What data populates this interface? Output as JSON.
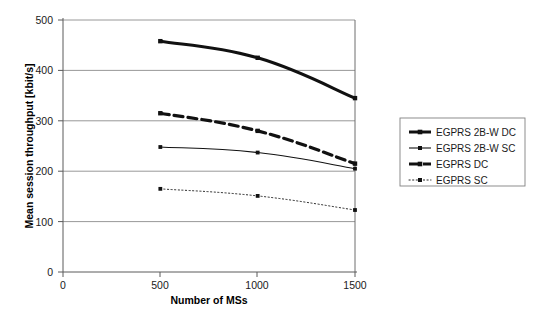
{
  "chart_data": {
    "type": "line",
    "title": "",
    "xlabel": "Number of MSs",
    "ylabel": "Mean session throughput [kbit/s]",
    "x": [
      500,
      1000,
      1500
    ],
    "xlim": [
      0,
      1750
    ],
    "ylim": [
      0,
      500
    ],
    "xticks": [
      0,
      500,
      1000,
      1500
    ],
    "xticklabels": [
      "0",
      "500",
      "1000",
      "1500"
    ],
    "yticks": [
      0,
      100,
      200,
      300,
      400,
      500
    ],
    "yticklabels": [
      "0",
      "100",
      "200",
      "300",
      "400",
      "500"
    ],
    "grid": "horizontal",
    "legend_position": "right",
    "series": [
      {
        "name": "EGPRS 2B-W DC",
        "values": [
          458,
          425,
          345
        ],
        "style": "solid",
        "width": "thick",
        "marker": "square",
        "color": "#111111"
      },
      {
        "name": "EGPRS 2B-W SC",
        "values": [
          248,
          237,
          205
        ],
        "style": "solid",
        "width": "thin",
        "marker": "square",
        "color": "#111111"
      },
      {
        "name": "EGPRS DC",
        "values": [
          315,
          280,
          215
        ],
        "style": "dashed",
        "width": "thick",
        "marker": "square",
        "color": "#111111"
      },
      {
        "name": "EGPRS SC",
        "values": [
          165,
          151,
          123
        ],
        "style": "dotted",
        "width": "thin",
        "marker": "square",
        "color": "#111111"
      }
    ]
  },
  "axes": {
    "y_title": "Mean session throughput [kbit/s]",
    "x_title": "Number of MSs",
    "y_tick_0": "0",
    "y_tick_100": "100",
    "y_tick_200": "200",
    "y_tick_300": "300",
    "y_tick_400": "400",
    "y_tick_500": "500",
    "x_tick_0": "0",
    "x_tick_500": "500",
    "x_tick_1000": "1000",
    "x_tick_1500": "1500"
  },
  "legend": {
    "entries": [
      {
        "label": "EGPRS 2B-W DC"
      },
      {
        "label": "EGPRS 2B-W SC"
      },
      {
        "label": "EGPRS DC"
      },
      {
        "label": "EGPRS SC"
      }
    ]
  }
}
